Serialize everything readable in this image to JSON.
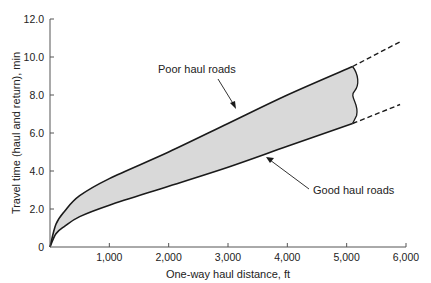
{
  "chart_data": {
    "type": "area",
    "title": "",
    "xlabel": "One-way haul distance, ft",
    "ylabel": "Travel time (haul and return), min",
    "xlim": [
      0,
      6000
    ],
    "ylim": [
      0,
      12
    ],
    "x_ticks": [
      1000,
      2000,
      3000,
      4000,
      5000,
      6000
    ],
    "x_tick_labels": [
      "1,000",
      "2,000",
      "3,000",
      "4,000",
      "5,000",
      "6,000"
    ],
    "y_ticks": [
      0,
      2,
      4,
      6,
      8,
      10,
      12
    ],
    "y_tick_labels": [
      "0",
      "2.0",
      "4.0",
      "6.0",
      "8.0",
      "10.0",
      "12.0"
    ],
    "grid": false,
    "legend": null,
    "fill_color": "#d9d9d9",
    "line_color": "#1a1a1a",
    "series": [
      {
        "name": "Poor haul roads",
        "x": [
          0,
          100,
          250,
          500,
          1000,
          2000,
          3000,
          4000,
          5100
        ],
        "values": [
          0,
          1.2,
          1.9,
          2.7,
          3.6,
          5.0,
          6.5,
          8.0,
          9.5
        ],
        "extrapolated_dashed": {
          "x": [
            5100,
            5900
          ],
          "values": [
            9.5,
            10.8
          ]
        }
      },
      {
        "name": "Good haul roads",
        "x": [
          0,
          100,
          250,
          500,
          1000,
          2000,
          3000,
          4000,
          5100
        ],
        "values": [
          0,
          0.7,
          1.1,
          1.6,
          2.2,
          3.2,
          4.2,
          5.3,
          6.5
        ],
        "extrapolated_dashed": {
          "x": [
            5100,
            5900
          ],
          "values": [
            6.5,
            7.5
          ]
        }
      }
    ],
    "annotations": [
      {
        "text": "Poor haul roads",
        "arrow_to": {
          "x": 3300,
          "y": 6.9
        }
      },
      {
        "text": "Good haul roads",
        "arrow_to": {
          "x": 3000,
          "y": 4.4
        }
      }
    ]
  }
}
